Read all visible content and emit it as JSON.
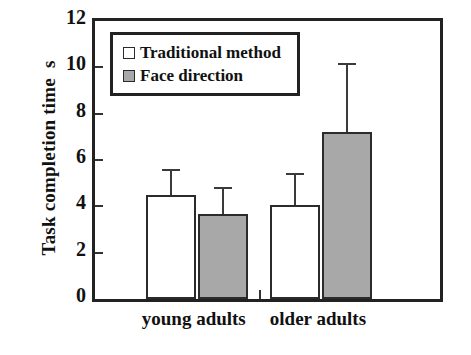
{
  "chart_data": {
    "type": "bar",
    "title": "",
    "xlabel": "",
    "ylabel": "Task completion time  s",
    "categories": [
      "young adults",
      "older adults"
    ],
    "series": [
      {
        "name": "Traditional method",
        "color": "#ffffff",
        "values": [
          4.5,
          4.05
        ],
        "errors": [
          1.1,
          1.4
        ]
      },
      {
        "name": "Face direction",
        "color": "#a8a8a8",
        "values": [
          3.67,
          7.2
        ],
        "errors": [
          1.15,
          3.0
        ]
      }
    ],
    "ylim": [
      0,
      12
    ],
    "ytick_values": [
      0,
      2,
      4,
      6,
      8,
      10,
      12
    ],
    "ytick_labels": [
      "0",
      "2",
      "4",
      "6",
      "8",
      "10",
      "12"
    ],
    "grid": false,
    "legend_position": "top-left",
    "error_bar_style": "upper-only-with-caps"
  },
  "axis": {
    "y_title": "Task completion time  s",
    "ticks": [
      "12",
      "10",
      "8",
      "6",
      "4",
      "2",
      "0"
    ]
  },
  "legend": {
    "items": [
      {
        "label": "Traditional method",
        "swatch": "white-square-icon"
      },
      {
        "label": "Face direction",
        "swatch": "gray-square-icon"
      }
    ]
  },
  "x_axis": {
    "categories": [
      "young adults",
      "older adults"
    ]
  },
  "colors": {
    "bar_traditional": "#ffffff",
    "bar_face": "#a8a8a8",
    "outline": "#2b2b2b",
    "text": "#111111"
  }
}
